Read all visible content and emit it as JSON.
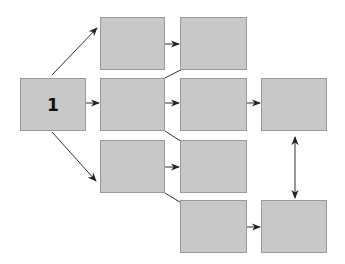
{
  "diagram": {
    "type": "flow-network",
    "colors": {
      "box_fill": "#c8c8c8",
      "box_border": "#9a9a9a",
      "arrow": "#222222",
      "background": "#ffffff"
    },
    "nodes": [
      {
        "id": "n1",
        "label": "1",
        "x": 20,
        "y": 78,
        "w": 66,
        "h": 53
      },
      {
        "id": "n2a",
        "label": "",
        "x": 100,
        "y": 17,
        "w": 65,
        "h": 53
      },
      {
        "id": "n2b",
        "label": "",
        "x": 100,
        "y": 78,
        "w": 65,
        "h": 53
      },
      {
        "id": "n2c",
        "label": "",
        "x": 100,
        "y": 140,
        "w": 65,
        "h": 53
      },
      {
        "id": "n3a",
        "label": "",
        "x": 180,
        "y": 17,
        "w": 67,
        "h": 53
      },
      {
        "id": "n3b",
        "label": "",
        "x": 180,
        "y": 78,
        "w": 67,
        "h": 53
      },
      {
        "id": "n3c",
        "label": "",
        "x": 180,
        "y": 140,
        "w": 67,
        "h": 53
      },
      {
        "id": "n3d",
        "label": "",
        "x": 180,
        "y": 200,
        "w": 67,
        "h": 53
      },
      {
        "id": "n4a",
        "label": "",
        "x": 261,
        "y": 78,
        "w": 66,
        "h": 53
      },
      {
        "id": "n4b",
        "label": "",
        "x": 261,
        "y": 200,
        "w": 66,
        "h": 53
      }
    ],
    "edges": [
      {
        "from": "n1",
        "to": "n2a",
        "type": "directed"
      },
      {
        "from": "n1",
        "to": "n2b",
        "type": "directed"
      },
      {
        "from": "n1",
        "to": "n2c",
        "type": "directed"
      },
      {
        "from": "n2a",
        "to": "n3a",
        "type": "directed"
      },
      {
        "from": "n2b",
        "to": "n3a",
        "type": "directed"
      },
      {
        "from": "n2b",
        "to": "n3b",
        "type": "directed"
      },
      {
        "from": "n2b",
        "to": "n3c",
        "type": "directed"
      },
      {
        "from": "n2c",
        "to": "n3c",
        "type": "directed"
      },
      {
        "from": "n2c",
        "to": "n3d",
        "type": "directed"
      },
      {
        "from": "n3b",
        "to": "n4a",
        "type": "directed"
      },
      {
        "from": "n3d",
        "to": "n4b",
        "type": "directed"
      },
      {
        "from": "n4a",
        "to": "n4b",
        "type": "bidirectional"
      }
    ]
  }
}
